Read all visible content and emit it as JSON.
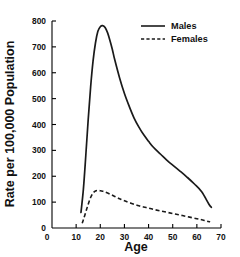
{
  "chart_data": {
    "type": "line",
    "title": "",
    "xlabel": "Age",
    "ylabel": "Rate per 100,000 Population",
    "xlim": [
      0,
      70
    ],
    "ylim": [
      0,
      800
    ],
    "grid": false,
    "legend_position": "top-right",
    "x_ticks": [
      0,
      10,
      20,
      30,
      40,
      50,
      60,
      70
    ],
    "x_tick_labels": [
      "0",
      "10",
      "20",
      "30",
      "40",
      "50",
      "60",
      "70"
    ],
    "y_ticks": [
      0,
      100,
      200,
      300,
      400,
      500,
      600,
      700,
      800
    ],
    "y_tick_labels": [
      "0",
      "100",
      "200",
      "300",
      "400",
      "500",
      "600",
      "700",
      "800"
    ],
    "series": [
      {
        "name": "Males",
        "style": "solid",
        "color": "#1a1a1a",
        "x": [
          12,
          13,
          14,
          15,
          16,
          17,
          18,
          19,
          20,
          21,
          22,
          23,
          24,
          25,
          26,
          28,
          30,
          32,
          34,
          36,
          38,
          40,
          42,
          45,
          48,
          50,
          53,
          56,
          59,
          62,
          65,
          66
        ],
        "y": [
          60,
          150,
          280,
          420,
          545,
          645,
          715,
          760,
          778,
          782,
          775,
          755,
          725,
          690,
          650,
          580,
          520,
          470,
          425,
          390,
          360,
          335,
          312,
          285,
          258,
          243,
          220,
          196,
          170,
          140,
          92,
          80
        ]
      },
      {
        "name": "Females",
        "style": "dashed",
        "color": "#1a1a1a",
        "x": [
          12.5,
          13,
          14,
          15,
          16,
          17,
          18,
          19,
          20,
          21,
          22,
          24,
          26,
          28,
          30,
          33,
          36,
          39,
          42,
          45,
          48,
          51,
          54,
          57,
          60,
          62,
          64,
          65.5
        ],
        "y": [
          18,
          32,
          62,
          92,
          118,
          135,
          143,
          145,
          144,
          142,
          139,
          131,
          122,
          113,
          105,
          95,
          86,
          79,
          72,
          66,
          60,
          54,
          48,
          42,
          36,
          32,
          27,
          24
        ]
      }
    ]
  },
  "legend": {
    "entries": [
      {
        "label": "Males",
        "style": "solid"
      },
      {
        "label": "Females",
        "style": "dashed"
      }
    ]
  },
  "axes": {
    "x_title": "Age",
    "y_title": "Rate per 100,000 Population"
  }
}
